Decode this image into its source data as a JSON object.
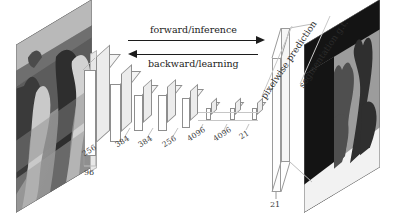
{
  "figure": {
    "type": "diagram",
    "flow": {
      "forward_label": "forward/inference",
      "backward_label": "backward/learning"
    },
    "input": {
      "caption": "",
      "depth_label": "96",
      "description": "grayscale photograph of two animals"
    },
    "layers": [
      {
        "label": "96",
        "name": "conv1"
      },
      {
        "label": "256",
        "name": "conv2"
      },
      {
        "label": "384",
        "name": "conv3"
      },
      {
        "label": "384",
        "name": "conv4"
      },
      {
        "label": "256",
        "name": "conv5"
      },
      {
        "label": "4096",
        "name": "fc6"
      },
      {
        "label": "4096",
        "name": "fc7"
      },
      {
        "label": "21",
        "name": "score"
      }
    ],
    "prediction": {
      "caption": "pixelwise prediction",
      "depth_label": "21"
    },
    "groundtruth": {
      "caption": "segmentation g.t."
    },
    "colors": {
      "ink": "#1c1c1c",
      "box_outline": "#8e8e8e",
      "box_fill": "#ffffff",
      "gt_background": "#9a9a9a",
      "gt_object": "#4a4a4a",
      "gt_border": "#141414"
    }
  }
}
